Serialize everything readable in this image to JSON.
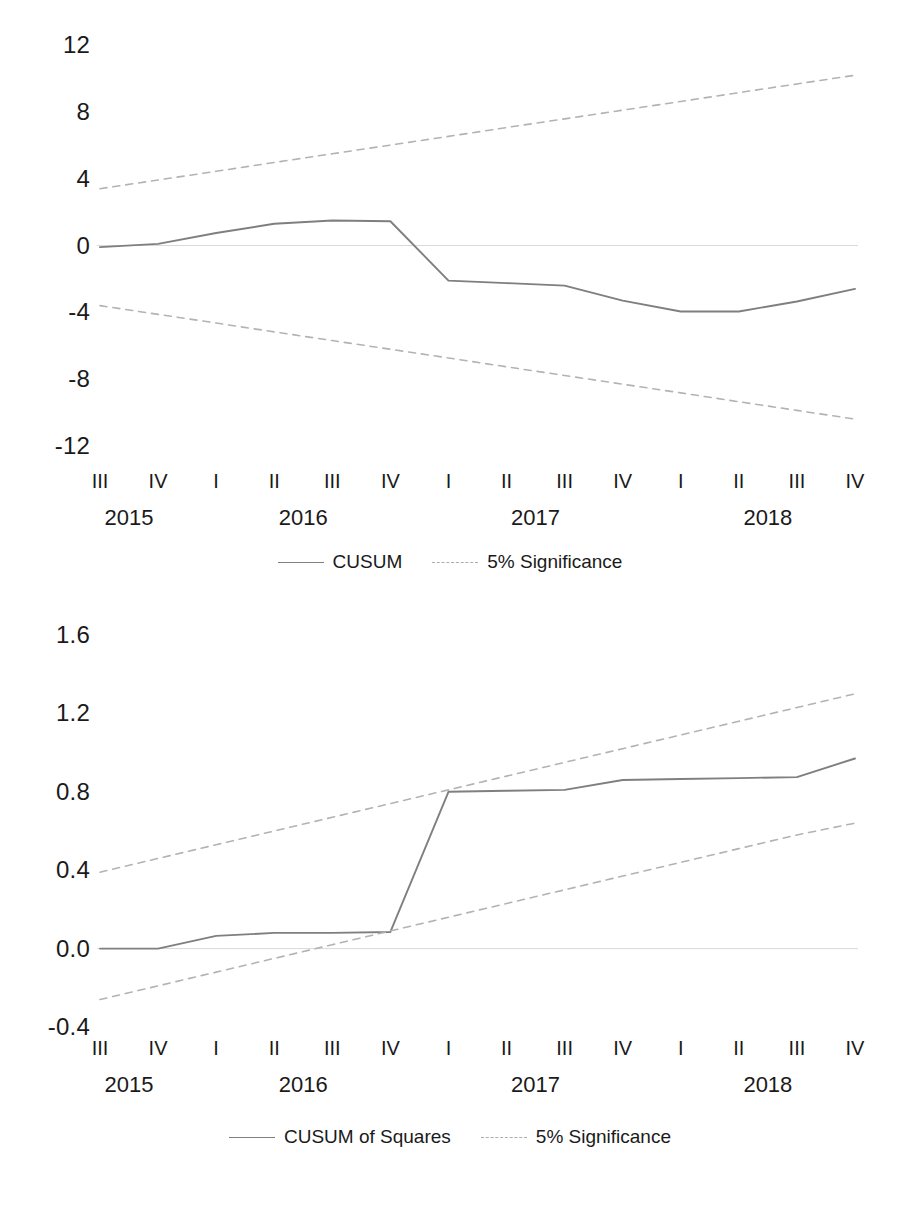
{
  "figure": {
    "background": "#ffffff",
    "series_color": "#7f7f7f",
    "bound_color": "#b3b3b3",
    "zero_line_color": "#d9d9d9"
  },
  "charts": [
    {
      "id": "cusum",
      "chart_data": {
        "type": "line",
        "title": "",
        "xlabel": "",
        "ylabel": "",
        "ylim": [
          -12,
          12
        ],
        "yticks": [
          "12",
          "8",
          "4",
          "0",
          "-4",
          "-8",
          "-12"
        ],
        "ytick_values": [
          12,
          8,
          4,
          0,
          -4,
          -8,
          -12
        ],
        "grid": false,
        "legend_position": "bottom-center",
        "categories": [
          "III",
          "IV",
          "I",
          "II",
          "III",
          "IV",
          "I",
          "II",
          "III",
          "IV",
          "I",
          "II",
          "III",
          "IV"
        ],
        "groups": [
          {
            "label": "2015",
            "span": 2
          },
          {
            "label": "2016",
            "span": 4
          },
          {
            "label": "2017",
            "span": 4
          },
          {
            "label": "2018",
            "span": 4
          }
        ],
        "series": [
          {
            "name": "CUSUM",
            "style": "solid",
            "color": "#7f7f7f",
            "values": [
              -0.1,
              0.1,
              0.75,
              1.3,
              1.5,
              1.45,
              -2.1,
              -2.25,
              -2.4,
              -3.3,
              -3.95,
              -3.95,
              -3.35,
              -2.6
            ]
          },
          {
            "name": "5% Significance",
            "style": "dashed",
            "color": "#b3b3b3",
            "values": [
              3.4,
              3.92,
              4.44,
              4.97,
              5.49,
              6.01,
              6.53,
              7.06,
              7.58,
              8.1,
              8.62,
              9.15,
              9.67,
              10.19
            ]
          },
          {
            "name": "5% Significance",
            "style": "dashed",
            "color": "#b3b3b3",
            "values": [
              -3.6,
              -4.12,
              -4.64,
              -5.17,
              -5.69,
              -6.21,
              -6.73,
              -7.26,
              -7.78,
              -8.3,
              -8.82,
              -9.35,
              -9.87,
              -10.39
            ]
          }
        ],
        "legend": [
          {
            "label": "CUSUM",
            "style": "solid"
          },
          {
            "label": "5% Significance",
            "style": "dashed"
          }
        ]
      }
    },
    {
      "id": "cusum-of-squares",
      "chart_data": {
        "type": "line",
        "title": "",
        "xlabel": "",
        "ylabel": "",
        "ylim": [
          -0.4,
          1.6
        ],
        "yticks": [
          "1.6",
          "1.2",
          "0.8",
          "0.4",
          "0.0",
          "-0.4"
        ],
        "ytick_values": [
          1.6,
          1.2,
          0.8,
          0.4,
          0.0,
          -0.4
        ],
        "grid": false,
        "legend_position": "bottom-center",
        "categories": [
          "III",
          "IV",
          "I",
          "II",
          "III",
          "IV",
          "I",
          "II",
          "III",
          "IV",
          "I",
          "II",
          "III",
          "IV"
        ],
        "groups": [
          {
            "label": "2015",
            "span": 2
          },
          {
            "label": "2016",
            "span": 4
          },
          {
            "label": "2017",
            "span": 4
          },
          {
            "label": "2018",
            "span": 4
          }
        ],
        "series": [
          {
            "name": "CUSUM of Squares",
            "style": "solid",
            "color": "#7f7f7f",
            "values": [
              0.0,
              0.0,
              0.065,
              0.08,
              0.08,
              0.085,
              0.8,
              0.805,
              0.81,
              0.86,
              0.865,
              0.87,
              0.875,
              0.97
            ]
          },
          {
            "name": "5% Significance",
            "style": "dashed",
            "color": "#b3b3b3",
            "values": [
              0.39,
              0.46,
              0.53,
              0.6,
              0.67,
              0.74,
              0.81,
              0.88,
              0.95,
              1.02,
              1.09,
              1.16,
              1.23,
              1.3
            ]
          },
          {
            "name": "5% Significance",
            "style": "dashed",
            "color": "#b3b3b3",
            "values": [
              -0.26,
              -0.19,
              -0.12,
              -0.05,
              0.02,
              0.09,
              0.16,
              0.23,
              0.3,
              0.37,
              0.44,
              0.51,
              0.58,
              0.64
            ]
          }
        ],
        "legend": [
          {
            "label": "CUSUM of Squares",
            "style": "solid"
          },
          {
            "label": "5% Significance",
            "style": "dashed"
          }
        ]
      }
    }
  ]
}
